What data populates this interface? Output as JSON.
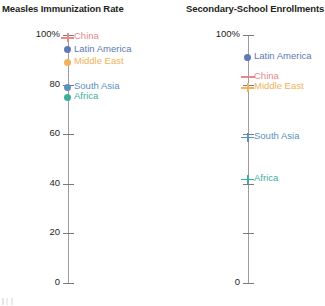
{
  "chart_data": [
    {
      "type": "scatter",
      "title": "Measles Immunization Rate",
      "xlabel": "",
      "ylabel": "",
      "ylim": [
        0,
        100
      ],
      "yticks": [
        0,
        20,
        40,
        60,
        80,
        100
      ],
      "ytick_labels": [
        "0",
        "20",
        "40",
        "60",
        "80",
        "100%"
      ],
      "grid": false,
      "legend": "inline-labels",
      "categories": [
        "China",
        "Latin America",
        "Middle East",
        "South Asia",
        "Africa"
      ],
      "values": [
        99,
        94,
        89,
        79,
        75
      ],
      "points": [
        {
          "label": "China",
          "value": 99,
          "color": "#e8888a",
          "marker": "cross"
        },
        {
          "label": "Latin America",
          "value": 94,
          "color": "#6079b4",
          "marker": "dot"
        },
        {
          "label": "Middle East",
          "value": 89,
          "color": "#f0b25a",
          "marker": "dot"
        },
        {
          "label": "South Asia",
          "value": 79,
          "color": "#5b8fc0",
          "marker": "dot"
        },
        {
          "label": "Africa",
          "value": 75,
          "color": "#3fae9e",
          "marker": "dot"
        }
      ]
    },
    {
      "type": "scatter",
      "title": "Secondary-School Enrollments",
      "xlabel": "",
      "ylabel": "",
      "ylim": [
        0,
        100
      ],
      "yticks": [
        0,
        20,
        40,
        60,
        80,
        100
      ],
      "ytick_labels": [
        "0",
        "",
        "",
        "",
        "",
        "100%"
      ],
      "grid": false,
      "legend": "inline-labels",
      "categories": [
        "Latin America",
        "China",
        "Middle East",
        "South Asia",
        "Africa"
      ],
      "values": [
        91,
        83,
        79,
        59,
        42
      ],
      "points": [
        {
          "label": "Latin America",
          "value": 91,
          "color": "#6079b4",
          "marker": "dot"
        },
        {
          "label": "China",
          "value": 83,
          "color": "#e8888a",
          "marker": "wide"
        },
        {
          "label": "Middle East",
          "value": 79,
          "color": "#f0b25a",
          "marker": "cross"
        },
        {
          "label": "South Asia",
          "value": 59,
          "color": "#5b8fc0",
          "marker": "cross"
        },
        {
          "label": "Africa",
          "value": 42,
          "color": "#3fae9e",
          "marker": "cross"
        }
      ]
    }
  ],
  "colors": {
    "axis": "#9d9d9d",
    "tick": "#7a7a7a",
    "text": "#231f20",
    "china": "#e8888a",
    "latin_america": "#6079b4",
    "middle_east": "#f0b25a",
    "south_asia": "#5b8fc0",
    "africa": "#3fae9e"
  }
}
